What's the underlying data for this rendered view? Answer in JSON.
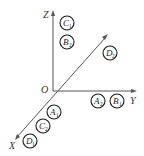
{
  "diagram": {
    "axes": [
      {
        "id": "z",
        "label": "Z"
      },
      {
        "id": "y",
        "label": "Y"
      },
      {
        "id": "x",
        "label": "X"
      }
    ],
    "origin_label": "O",
    "nodes": [
      {
        "id": "C1",
        "letter": "C",
        "sub": "1"
      },
      {
        "id": "B2",
        "letter": "B",
        "sub": "2"
      },
      {
        "id": "D2",
        "letter": "D",
        "sub": "2"
      },
      {
        "id": "A2",
        "letter": "A",
        "sub": "2"
      },
      {
        "id": "B1",
        "letter": "B",
        "sub": "1"
      },
      {
        "id": "A1",
        "letter": "A",
        "sub": "1"
      },
      {
        "id": "C2",
        "letter": "C",
        "sub": "2"
      },
      {
        "id": "D1",
        "letter": "D",
        "sub": "1"
      }
    ]
  }
}
